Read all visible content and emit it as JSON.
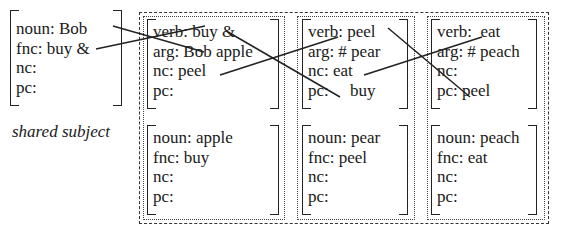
{
  "subject": {
    "rows": [
      "noun: Bob",
      "fnc: buy &",
      "nc:",
      "pc:"
    ],
    "caption": "shared subject"
  },
  "columns": [
    {
      "verb": {
        "rows": [
          "verb: buy &",
          "arg: Bob apple",
          "nc: peel",
          "pc:"
        ]
      },
      "noun": {
        "rows": [
          "noun:  apple",
          "fnc: buy",
          "nc:",
          "pc:"
        ]
      }
    },
    {
      "verb": {
        "rows": [
          "verb: peel",
          "arg: # pear",
          "nc: eat",
          "pc:     buy"
        ]
      },
      "noun": {
        "rows": [
          "noun: pear",
          "fnc: peel",
          "nc:",
          "pc:"
        ]
      }
    },
    {
      "verb": {
        "rows": [
          "verb:  eat",
          "arg: # peach",
          "nc:",
          "pc: peel"
        ]
      },
      "noun": {
        "rows": [
          "noun: peach",
          "fnc: eat",
          "nc:",
          "pc:"
        ]
      }
    }
  ],
  "links": [
    {
      "from": "subject.noun:Bob",
      "to": "col1.arg:Bob"
    },
    {
      "from": "subject.fnc:buy&",
      "to": "col1.verb:buy&"
    },
    {
      "from": "col1.verb:buy&",
      "to": "col2.pc:buy"
    },
    {
      "from": "col1.nc:peel",
      "to": "col2.verb:peel"
    },
    {
      "from": "col2.verb:peel",
      "to": "col3.pc:peel"
    },
    {
      "from": "col2.nc:eat",
      "to": "col3.verb:eat"
    }
  ],
  "colors": {
    "ink": "#1a1a1a",
    "background": "#ffffff"
  }
}
